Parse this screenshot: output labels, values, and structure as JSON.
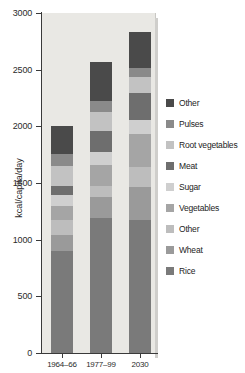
{
  "chart_data": {
    "type": "bar",
    "title": "",
    "subtitle": "",
    "xlabel": "",
    "ylabel": "kcal/capita/day",
    "ylim": [
      0,
      3000
    ],
    "yticks": [
      0,
      500,
      1000,
      1500,
      2000,
      2500,
      3000
    ],
    "ytick_labels": [
      "0",
      "500",
      "1000",
      "1500",
      "2000",
      "2500",
      "3000"
    ],
    "grid": false,
    "stacked": true,
    "legend_position": "right",
    "categories": [
      "1964–66",
      "1977–99",
      "2030"
    ],
    "series": [
      {
        "name": "Rice",
        "color": "#7a7a7a",
        "values": [
          900,
          1190,
          1175
        ]
      },
      {
        "name": "Wheat",
        "color": "#9a9a9a",
        "values": [
          140,
          190,
          290
        ]
      },
      {
        "name": "Other",
        "color": "#bdbdbd",
        "values": [
          135,
          90,
          180
        ]
      },
      {
        "name": "Vegetables",
        "color": "#a5a5a5",
        "values": [
          120,
          190,
          290
        ]
      },
      {
        "name": "Sugar",
        "color": "#cfcfcf",
        "values": [
          100,
          110,
          120
        ]
      },
      {
        "name": "Meat",
        "color": "#6e6e6e",
        "values": [
          75,
          185,
          235
        ]
      },
      {
        "name": "Root vegetables",
        "color": "#c2c2c2",
        "values": [
          180,
          175,
          145
        ]
      },
      {
        "name": "Pulses",
        "color": "#8a8a8a",
        "values": [
          110,
          95,
          80
        ]
      },
      {
        "name": "Other",
        "color": "#4a4a4a",
        "values": [
          240,
          345,
          315
        ]
      }
    ],
    "totals": [
      2000,
      2570,
      2830
    ],
    "units": "kcal/capita/day"
  },
  "legend": {
    "items": [
      {
        "label": "Other",
        "color": "#4a4a4a"
      },
      {
        "label": "Pulses",
        "color": "#8a8a8a"
      },
      {
        "label": "Root vegetables",
        "color": "#c2c2c2"
      },
      {
        "label": "Meat",
        "color": "#6e6e6e"
      },
      {
        "label": "Sugar",
        "color": "#cfcfcf"
      },
      {
        "label": "Vegetables",
        "color": "#a5a5a5"
      },
      {
        "label": "Other",
        "color": "#bdbdbd"
      },
      {
        "label": "Wheat",
        "color": "#9a9a9a"
      },
      {
        "label": "Rice",
        "color": "#7a7a7a"
      }
    ]
  }
}
